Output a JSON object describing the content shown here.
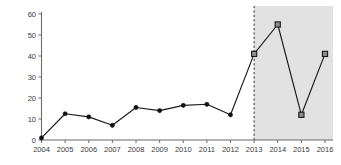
{
  "chart_data": {
    "type": "line",
    "title": "",
    "xlabel": "",
    "ylabel": "",
    "categories": [
      "2004",
      "2005",
      "2006",
      "2007",
      "2008",
      "2009",
      "2010",
      "2011",
      "2012",
      "2013",
      "2014",
      "2015",
      "2016"
    ],
    "values": [
      1,
      12.5,
      11,
      7,
      15.5,
      14,
      16.5,
      17,
      12,
      41,
      55,
      12,
      41
    ],
    "series": [
      {
        "name": "",
        "values": [
          1,
          12.5,
          11,
          7,
          15.5,
          14,
          16.5,
          17,
          12,
          41,
          55,
          12,
          41
        ]
      }
    ],
    "ylim": [
      0,
      60
    ],
    "ytick_labels": [
      "0",
      "10",
      "20",
      "30",
      "40",
      "50",
      "60"
    ],
    "ytick_values": [
      0,
      10,
      20,
      30,
      40,
      50,
      60
    ],
    "grid": false,
    "legend": "none",
    "marker_styles": [
      "circle",
      "circle",
      "circle",
      "circle",
      "circle",
      "circle",
      "circle",
      "circle",
      "circle",
      "square",
      "square",
      "square",
      "square"
    ],
    "annotations": [
      {
        "name": "xi-jinping-era-label",
        "text": "시진핑 집권시기",
        "x_category": "2014.5",
        "y_value": 6
      }
    ],
    "shaded_region": {
      "name": "xi-jinping-era-band",
      "from": "2013",
      "to": "2016",
      "color": "#e2e2e2",
      "divider_at": "2013",
      "divider_style": "dashed",
      "divider_color": "#2b2b2b"
    },
    "colors": {
      "line": "#1a1a1a",
      "circle_marker": "#111111",
      "square_marker_fill": "#8c8c8c",
      "square_marker_edge": "#1a1a1a",
      "axis": "#6b6b6b",
      "band": "#e2e2e2",
      "background": "#ffffff"
    }
  }
}
